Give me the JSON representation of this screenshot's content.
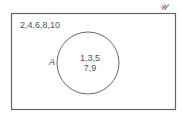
{
  "diagram": {
    "type": "venn",
    "universal_label": "𝒰",
    "outside_elements": "2,4,6,8,10",
    "set": {
      "label": "A",
      "elements_line1": "1,3,5",
      "elements_line2": "7,9"
    },
    "colors": {
      "stroke": "#666666",
      "text": "#555555",
      "background": "#ffffff"
    }
  }
}
